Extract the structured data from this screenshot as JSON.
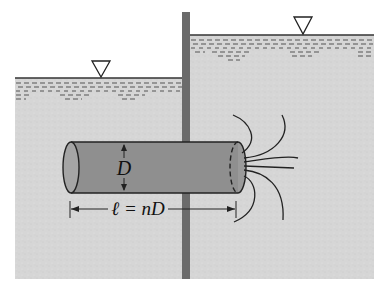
{
  "diagram": {
    "labels": {
      "diameter": "D",
      "length": "ℓ = nD"
    },
    "elements": {
      "left_water_surface_symbol": "▽",
      "right_water_surface_symbol": "▽"
    },
    "colors": {
      "soil": "#d6d6d6",
      "water_dash": "#555555",
      "wall": "#6b6b6b",
      "pipe": "#8f8f8f",
      "pipe_end": "#a5a5a5",
      "line": "#222222",
      "background": "#ffffff"
    }
  }
}
